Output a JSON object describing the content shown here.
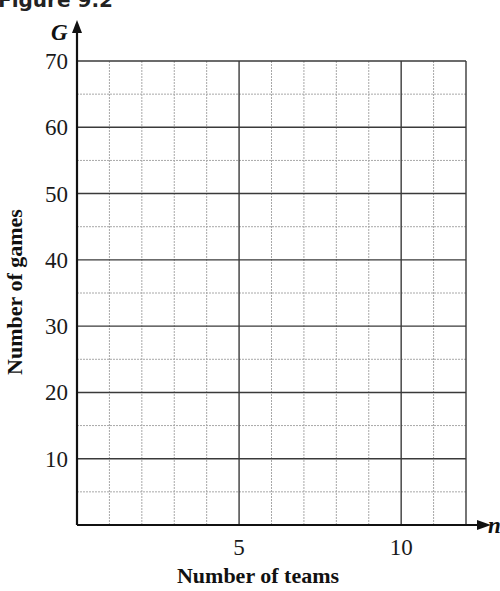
{
  "figure": {
    "label": "Figure 9.2"
  },
  "chart_data": {
    "type": "line",
    "title": "",
    "xlabel": "Number of teams",
    "ylabel": "Number of games",
    "x_variable": "n",
    "y_variable": "G",
    "xlim": [
      0,
      12
    ],
    "ylim": [
      0,
      70
    ],
    "x_ticks": [
      5,
      10
    ],
    "x_tick_labels": [
      "5",
      "10"
    ],
    "y_ticks": [
      10,
      20,
      30,
      40,
      50,
      60,
      70
    ],
    "y_tick_labels": [
      "10",
      "20",
      "30",
      "40",
      "50",
      "60",
      "70"
    ],
    "grid": {
      "on": true,
      "x_minor_step": 1,
      "x_major_step": 5,
      "y_minor_step": 5,
      "y_major_step": 10
    },
    "series": [],
    "note": "Blank grid for plotting; no data points drawn"
  },
  "colors": {
    "axis": "#111111",
    "major_grid": "#3a3a3a",
    "minor_grid": "#a8a8a8"
  }
}
